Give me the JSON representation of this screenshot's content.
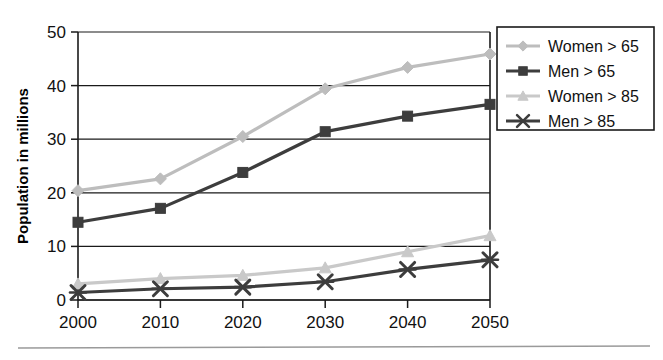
{
  "chart_data": {
    "type": "line",
    "title": "",
    "xlabel": "",
    "ylabel": "Population in millions",
    "categories": [
      "2000",
      "2010",
      "2020",
      "2030",
      "2040",
      "2050"
    ],
    "x": [
      2000,
      2010,
      2020,
      2030,
      2040,
      2050
    ],
    "xlim": [
      2000,
      2050
    ],
    "ylim": [
      0,
      50
    ],
    "yticks": [
      "0",
      "10",
      "20",
      "30",
      "40",
      "50"
    ],
    "ytick_values": [
      0,
      10,
      20,
      30,
      40,
      50
    ],
    "grid": "horizontal",
    "legend_position": "outside-top-right",
    "series": [
      {
        "name": "Women > 65",
        "marker": "diamond",
        "color": "#bdbdbd",
        "values": [
          20.4,
          22.6,
          30.5,
          39.4,
          43.4,
          45.9
        ]
      },
      {
        "name": "Men > 65",
        "marker": "square",
        "color": "#3d3d3d",
        "values": [
          14.5,
          17.1,
          23.8,
          31.4,
          34.3,
          36.5
        ]
      },
      {
        "name": "Women > 85",
        "marker": "triangle",
        "color": "#c9c9c9",
        "values": [
          3.0,
          4.0,
          4.6,
          6.0,
          9.0,
          12.0
        ]
      },
      {
        "name": "Men > 85",
        "marker": "x-star",
        "color": "#3d3d3d",
        "values": [
          1.4,
          2.1,
          2.4,
          3.4,
          5.7,
          7.5
        ]
      }
    ]
  },
  "figure": {
    "y_axis_title": "Population in millions",
    "legend_items": [
      {
        "label": "Women > 65",
        "icon": "diamond-marker-icon"
      },
      {
        "label": "Men > 65",
        "icon": "square-marker-icon"
      },
      {
        "label": "Women > 85",
        "icon": "triangle-marker-icon"
      },
      {
        "label": "Men > 85",
        "icon": "x-star-marker-icon"
      }
    ],
    "x_tick_labels": [
      "2000",
      "2010",
      "2020",
      "2030",
      "2040",
      "2050"
    ],
    "y_tick_labels": [
      "0",
      "10",
      "20",
      "30",
      "40",
      "50"
    ]
  }
}
